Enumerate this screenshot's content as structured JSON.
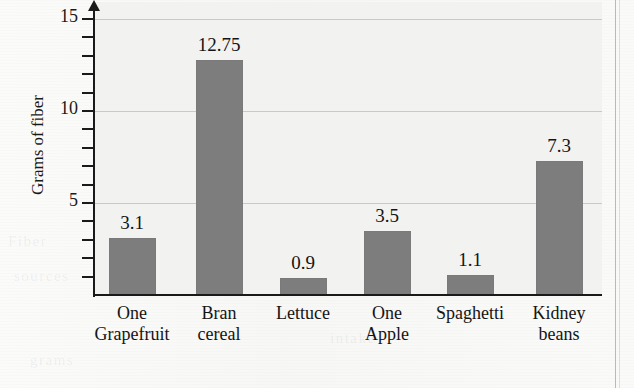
{
  "chart_data": {
    "type": "bar",
    "title": "",
    "xlabel": "",
    "ylabel": "Grams of fiber",
    "categories": [
      "One Grapefruit",
      "Bran cereal",
      "Lettuce",
      "One Apple",
      "Spaghetti",
      "Kidney beans"
    ],
    "category_lines": [
      [
        "One",
        "Grapefruit"
      ],
      [
        "Bran",
        "cereal"
      ],
      [
        "Lettuce",
        ""
      ],
      [
        "One",
        "Apple"
      ],
      [
        "Spaghetti",
        ""
      ],
      [
        "Kidney",
        "beans"
      ]
    ],
    "values": [
      3.1,
      12.75,
      0.9,
      3.5,
      1.1,
      7.3
    ],
    "value_labels": [
      "3.1",
      "12.75",
      "0.9",
      "3.5",
      "1.1",
      "7.3"
    ],
    "ylim": [
      0,
      15.9
    ],
    "ytick_labels": [
      "5",
      "10",
      "15"
    ],
    "ytick_values": [
      5,
      10,
      15
    ],
    "minor_tick_interval": 1,
    "gridlines": [
      5,
      10,
      15
    ],
    "grid": true,
    "legend": "none",
    "bar_color": "#7d7d7d",
    "axis_color": "#1a1a1a",
    "gridline_color": "#c9c9c7",
    "plot_background": "#f2f2f1"
  },
  "page": {
    "showthrough": [
      "Fiber",
      "sources",
      "grams",
      "daily",
      "intake"
    ]
  }
}
